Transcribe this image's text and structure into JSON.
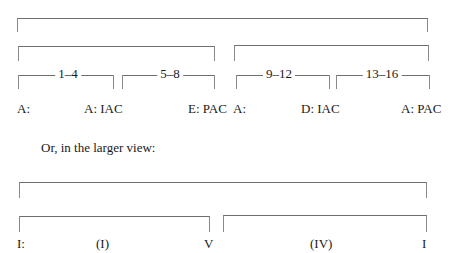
{
  "top_diagram": {
    "segments": [
      {
        "label": "1–4"
      },
      {
        "label": "5–8"
      },
      {
        "label": "9–12"
      },
      {
        "label": "13–16"
      }
    ],
    "labels": [
      "A:",
      "A: IAC",
      "E: PAC",
      "A:",
      "D: IAC",
      "A: PAC"
    ]
  },
  "caption": "Or, in the larger view:",
  "bottom_diagram": {
    "labels": [
      "I:",
      "(I)",
      "V",
      "(IV)",
      "I"
    ]
  }
}
